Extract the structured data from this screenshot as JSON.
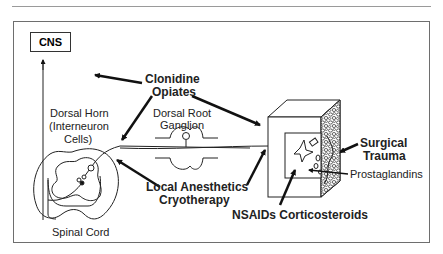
{
  "diagram": {
    "type": "pain-pathway-intervention-sites",
    "nodes": {
      "cns": "CNS",
      "dorsal_horn": [
        "Dorsal Horn",
        "(Interneuron",
        "Cells)"
      ],
      "dorsal_root_ganglion": [
        "Dorsal Root",
        "Ganglion"
      ],
      "spinal_cord": "Spinal Cord",
      "surgical_trauma": [
        "Surgical",
        "Trauma"
      ],
      "prostaglandins": "Prostaglandins"
    },
    "interventions": {
      "central": [
        "Clonidine",
        "Opiates"
      ],
      "nerve": [
        "Local Anesthetics",
        "Cryotherapy"
      ],
      "peripheral": "NSAIDs Corticosteroids"
    },
    "colors": {
      "line": "#222222",
      "frame": "#6e6e6e",
      "rule": "#9a9a9a",
      "background": "#ffffff"
    }
  }
}
